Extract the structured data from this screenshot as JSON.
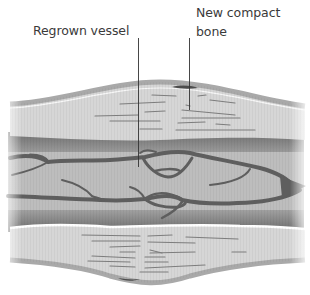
{
  "diagram": {
    "labels": [
      {
        "id": "regrown-vessel",
        "text": "Regrown vessel"
      },
      {
        "id": "new-compact-bone",
        "lines": [
          "New compact",
          "bone"
        ]
      }
    ],
    "colors": {
      "background": "#ffffff",
      "bone_fill": "#d6d6d6",
      "bone_cortex": "#a9a9a9",
      "marrow_dark": "#7a7a7a",
      "marrow_mid": "#b4b4b4",
      "vessel": "#5e5e5e",
      "label_text": "#3a3a3a",
      "leader_line": "#333333"
    }
  }
}
